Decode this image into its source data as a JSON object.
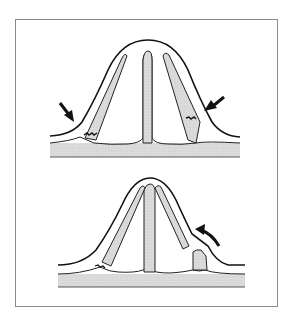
{
  "figure": {
    "panels": [
      {
        "id": "top",
        "description": "intact ridge with three projections; arrows indicating compression at base of outer projections"
      },
      {
        "id": "bottom",
        "description": "fractured outer projections leaning inward; curved arrow indicating displacement"
      }
    ],
    "colors": {
      "outline": "#1a1a1a",
      "fill": "#d9d9d9",
      "frame": "#8c8c8c",
      "background": "#ffffff"
    }
  }
}
